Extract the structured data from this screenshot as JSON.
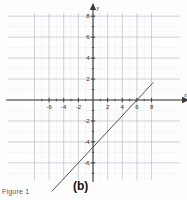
{
  "figure": {
    "caption": "Figure 1",
    "panel_label": "(b)"
  },
  "chart_data": {
    "type": "line",
    "title": "",
    "xlabel": "x",
    "ylabel": "y",
    "xlim": [
      -8,
      8.6
    ],
    "ylim": [
      -8,
      8.6
    ],
    "grid": true,
    "minor_grid_step": 1,
    "major_grid_step": 2,
    "legend": "none",
    "axis_arrow_x_label": "x",
    "axis_arrow_y_label": "y",
    "x_tick_labels": [
      "-6",
      "-4",
      "-2",
      "2",
      "4",
      "6",
      "8"
    ],
    "x_tick_values": [
      -6,
      -4,
      -2,
      2,
      4,
      6,
      8
    ],
    "y_tick_labels": [
      "8",
      "6",
      "4",
      "2",
      "-2",
      "-4",
      "-6"
    ],
    "y_tick_values": [
      8,
      6,
      4,
      2,
      -2,
      -4,
      -6
    ],
    "series": [
      {
        "name": "line",
        "equation": "y = 0.75x - 4.5",
        "slope": 0.75,
        "y_intercept": -4.5,
        "x_intercept": 6,
        "color": "#4a4a4a",
        "x": [
          -5.6,
          8.2
        ],
        "y": [
          -8.7,
          1.65
        ],
        "endpoints": [
          [
            -5.6,
            -8.7
          ],
          [
            8.2,
            1.65
          ]
        ]
      }
    ],
    "colors": {
      "grid_minor": "#cfd4dd",
      "grid_major": "#b8bec9",
      "axis": "#3a3a3a",
      "line": "#5a5a5a",
      "text": "#2a2a2a"
    }
  }
}
